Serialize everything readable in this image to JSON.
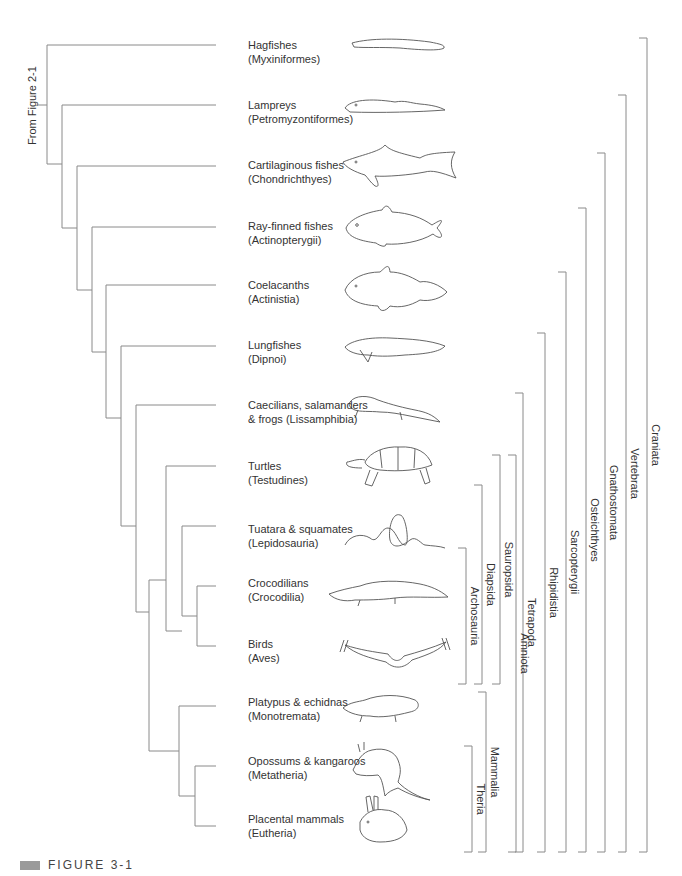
{
  "root_label": "From Figure 2-1",
  "taxa": [
    {
      "common": "Hagfishes",
      "formal": "(Myxiniformes)",
      "icon": "hagfish-icon",
      "y": 46
    },
    {
      "common": "Lampreys",
      "formal": "(Petromyzontiformes)",
      "icon": "lamprey-icon",
      "y": 106
    },
    {
      "common": "Cartilaginous fishes",
      "formal": "(Chondrichthyes)",
      "icon": "shark-icon",
      "y": 166
    },
    {
      "common": "Ray-finned fishes",
      "formal": "(Actinopterygii)",
      "icon": "ray-finned-fish-icon",
      "y": 227
    },
    {
      "common": "Coelacanths",
      "formal": "(Actinistia)",
      "icon": "coelacanth-icon",
      "y": 286
    },
    {
      "common": "Lungfishes",
      "formal": "(Dipnoi)",
      "icon": "lungfish-icon",
      "y": 346
    },
    {
      "common": "Caecilians, salamanders",
      "formal": "& frogs (Lissamphibia)",
      "icon": "salamander-icon",
      "y": 406
    },
    {
      "common": "Turtles",
      "formal": "(Testudines)",
      "icon": "turtle-icon",
      "y": 467
    },
    {
      "common": "Tuatara & squamates",
      "formal": "(Lepidosauria)",
      "icon": "snake-icon",
      "y": 530
    },
    {
      "common": "Crocodilians",
      "formal": "(Crocodilia)",
      "icon": "crocodile-icon",
      "y": 584
    },
    {
      "common": "Birds",
      "formal": "(Aves)",
      "icon": "bird-icon",
      "y": 645
    },
    {
      "common": "Platypus & echidnas",
      "formal": "(Monotremata)",
      "icon": "platypus-icon",
      "y": 703
    },
    {
      "common": "Opossums & kangaroos",
      "formal": "(Metatheria)",
      "icon": "kangaroo-icon",
      "y": 762
    },
    {
      "common": "Placental mammals",
      "formal": "(Eutheria)",
      "icon": "rabbit-icon",
      "y": 820
    }
  ],
  "clades": [
    {
      "name": "Archosauria",
      "x": 466,
      "top": 548,
      "bottom": 684
    },
    {
      "name": "Diapsida",
      "x": 482,
      "top": 485,
      "bottom": 684
    },
    {
      "name": "Sauropsida",
      "x": 500,
      "top": 455,
      "bottom": 684
    },
    {
      "name": "Theria",
      "x": 472,
      "top": 746,
      "bottom": 852
    },
    {
      "name": "Mammalia",
      "x": 486,
      "top": 692,
      "bottom": 852
    },
    {
      "name": "Amniota",
      "x": 516,
      "top": 455,
      "bottom": 852
    },
    {
      "name": "Tetrapoda",
      "x": 523,
      "top": 393,
      "bottom": 852
    },
    {
      "name": "Rhipidistia",
      "x": 545,
      "top": 333,
      "bottom": 852
    },
    {
      "name": "Sarcopterygii",
      "x": 566,
      "top": 272,
      "bottom": 852
    },
    {
      "name": "Osteichthyes",
      "x": 586,
      "top": 208,
      "bottom": 852
    },
    {
      "name": "Gnathostomata",
      "x": 605,
      "top": 153,
      "bottom": 852
    },
    {
      "name": "Vertebrata",
      "x": 626,
      "top": 95,
      "bottom": 852
    },
    {
      "name": "Craniata",
      "x": 647,
      "top": 38,
      "bottom": 852
    }
  ],
  "caption": "FIGURE 3-1",
  "colors": {
    "line": "#8a8a8a",
    "text": "#333333",
    "caption_box": "#9a9a9a"
  }
}
